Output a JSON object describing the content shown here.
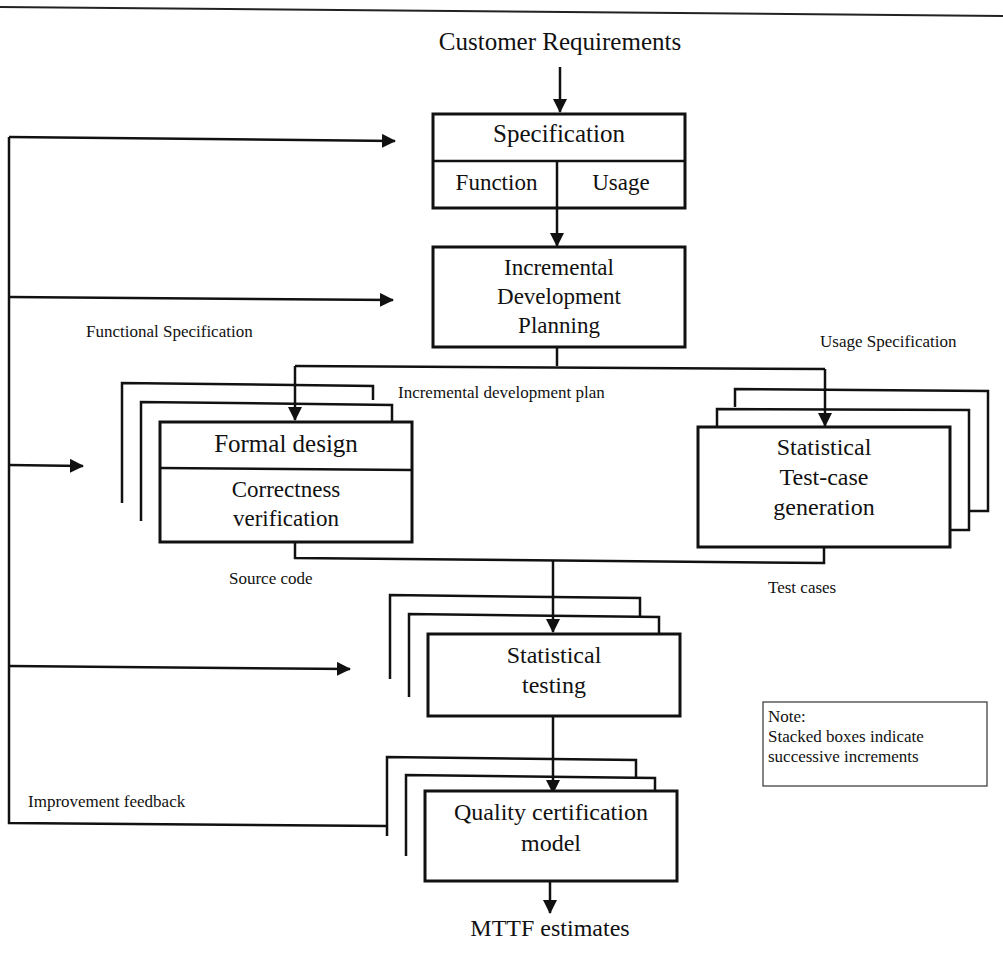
{
  "diagram": {
    "type": "flowchart",
    "title_top": "Customer Requirements",
    "output_bottom": "MTTF estimates",
    "nodes": {
      "specification": {
        "title": "Specification",
        "left": "Function",
        "right": "Usage"
      },
      "planning": {
        "line1": "Incremental",
        "line2": "Development",
        "line3": "Planning"
      },
      "formal_design": {
        "title": "Formal design",
        "line1": "Correctness",
        "line2": "verification"
      },
      "test_case_gen": {
        "line1": "Statistical",
        "line2": "Test-case",
        "line3": "generation"
      },
      "statistical_testing": {
        "line1": "Statistical",
        "line2": "testing"
      },
      "quality_cert": {
        "line1": "Quality certification",
        "line2": "model"
      }
    },
    "labels": {
      "functional_spec": "Functional Specification",
      "usage_spec": "Usage Specification",
      "incremental_plan": "Incremental development plan",
      "source_code": "Source code",
      "test_cases": "Test cases",
      "improvement_feedback": "Improvement feedback"
    },
    "note": {
      "line1": "Note:",
      "line2": "Stacked boxes indicate",
      "line3": "successive increments"
    }
  }
}
